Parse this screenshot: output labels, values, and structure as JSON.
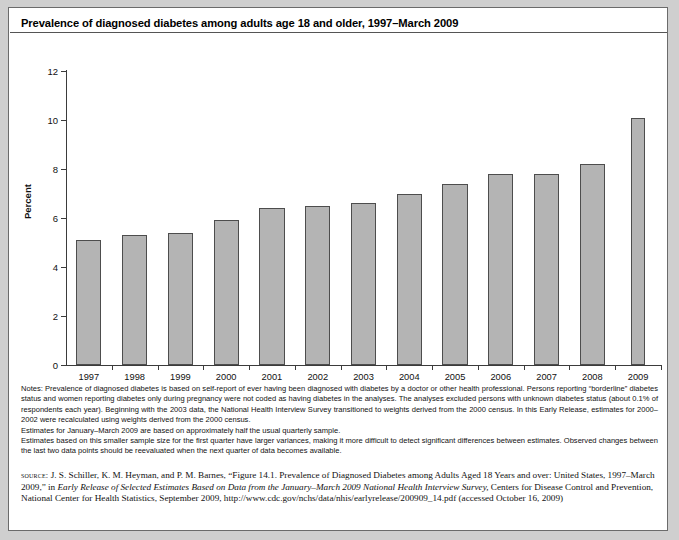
{
  "figure": {
    "title": "Prevalence of diagnosed diabetes among adults age 18 and older, 1997–March 2009"
  },
  "chart_data": {
    "type": "bar",
    "title": "Prevalence of diagnosed diabetes among adults age 18 and older, 1997–March 2009",
    "xlabel": "",
    "ylabel": "Percent",
    "ylim": [
      0,
      12
    ],
    "yticks": [
      0,
      2,
      4,
      6,
      8,
      10,
      12
    ],
    "grid": false,
    "legend": null,
    "categories": [
      "1997",
      "1998",
      "1999",
      "2000",
      "2001",
      "2002",
      "2003",
      "2004",
      "2005",
      "2006",
      "2007",
      "2008",
      "2009"
    ],
    "values": [
      5.1,
      5.3,
      5.4,
      5.9,
      6.4,
      6.5,
      6.6,
      7.0,
      7.4,
      7.8,
      7.8,
      8.2,
      10.1
    ],
    "bar_color": "#b4b4b4",
    "bar_edge_color": "#4d4d4d",
    "note_last_bar": "2009 bar is narrower — January–March 2009 partial-year estimate"
  },
  "notes": {
    "paragraphs": [
      "Notes: Prevalence of diagnosed diabetes is based on self-report of ever having been diagnosed with diabetes by a doctor or other health professional. Persons reporting “borderline” diabetes status and women reporting diabetes only during pregnancy were not coded as having diabetes in the analyses. The analyses excluded persons with unknown diabetes status (about 0.1% of respondents each year). Beginning with the 2003 data, the National Health Interview Survey transitioned to weights derived from the 2000 census. In this Early Release, estimates for 2000–2002 were recalculated using weights derived from the 2000 census.",
      "Estimates for January–March 2009 are based on approximately half the usual quarterly sample.",
      "Estimates based on this smaller sample size for the first quarter have larger variances, making it more difficult to detect significant differences between estimates. Observed changes between the last two data points should be reevaluated when the next quarter of data becomes available."
    ]
  },
  "source": {
    "label": "source:",
    "text_1": " J. S. Schiller, K. M. Heyman, and P. M. Barnes, “Figure 14.1. Prevalence of Diagnosed Diabetes among Adults Aged 18 Years and over: United States, 1997–March 2009,” in ",
    "italic_1": "Early Release of Selected Estimates Based on Data from the January–March 2009 National Health Interview Survey,",
    "text_2": " Centers for Disease Control and Prevention, National Center for Health Statistics, September 2009, http://www.cdc.gov/nchs/data/nhis/earlyrelease/200909_14.pdf (accessed October 16, 2009)"
  }
}
